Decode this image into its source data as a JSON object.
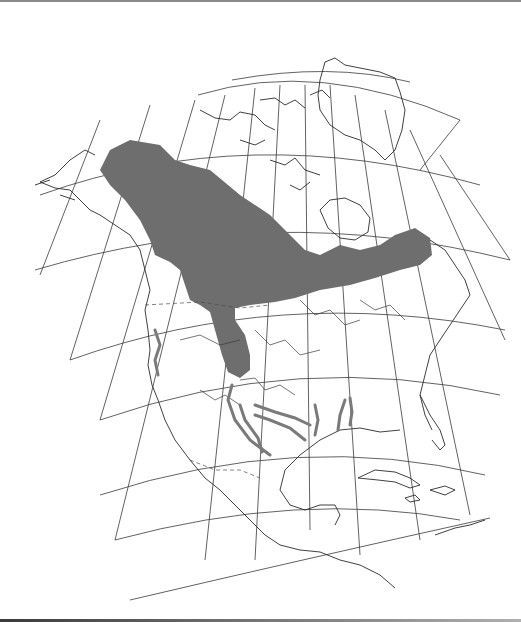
{
  "map": {
    "title": "Species range map — North America",
    "region": "North America",
    "projection": "conic (graticule shown)",
    "legend": [],
    "colors": {
      "background": "#ffffff",
      "range_fill": "#6e6e6e",
      "coastline": "#2a2a2a",
      "graticule": "#3a3a3a",
      "disjunct_river_ranges": "#7a7a7a"
    },
    "features": {
      "primary_range": "Boreal belt from Alaska across Canada to Labrador/Quebec, extending south along the Mississippi to upper Midwest",
      "disjunct_ranges": "Thickened river segments in Texas, Louisiana, Mississippi/Alabama, and along the Pacific coast (California/Oregon)"
    }
  }
}
